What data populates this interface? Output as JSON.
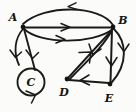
{
  "figure": {
    "background_color": "#fbfbf9",
    "ink_color": "#1a1a18",
    "width": 136,
    "height": 112
  },
  "nodes": [
    {
      "id": "A",
      "label": "A",
      "x": 23,
      "y": 27,
      "label_x": 13,
      "label_y": 20,
      "type": "vertex"
    },
    {
      "id": "B",
      "label": "B",
      "x": 113,
      "y": 27,
      "label_x": 121,
      "label_y": 23,
      "type": "vertex"
    },
    {
      "id": "C",
      "label": "C",
      "x": 31,
      "y": 82,
      "label_x": 31,
      "label_y": 85,
      "type": "vertex-loop"
    },
    {
      "id": "D",
      "label": "D",
      "x": 67,
      "y": 79,
      "label_x": 64,
      "label_y": 95,
      "type": "vertex"
    },
    {
      "id": "E",
      "label": "E",
      "x": 110,
      "y": 84,
      "label_x": 108,
      "label_y": 101,
      "type": "vertex"
    }
  ],
  "edges": [
    {
      "id": "e1",
      "from": "B",
      "to": "A",
      "style": "arc-above",
      "arrow_direction": "left"
    },
    {
      "id": "e2",
      "from": "A",
      "to": "B",
      "style": "straight",
      "arrow_direction": "right"
    },
    {
      "id": "e3",
      "from": "A",
      "to": "B",
      "style": "arc-below",
      "arrow_direction": "right"
    },
    {
      "id": "e4",
      "from": "A",
      "to": "C",
      "style": "arc-left",
      "arrow_direction": "down"
    },
    {
      "id": "e5",
      "from": "A",
      "to": "C",
      "style": "straight",
      "arrow_direction": "down"
    },
    {
      "id": "e6",
      "from": "C",
      "to": "C",
      "style": "self-loop",
      "arrow_direction": "ccw"
    },
    {
      "id": "e7",
      "from": "D",
      "to": "B",
      "style": "straight",
      "arrow_direction": "up-right"
    },
    {
      "id": "e8",
      "from": "B",
      "to": "D",
      "style": "arc-curved",
      "arrow_direction": "down-left"
    },
    {
      "id": "e9",
      "from": "B",
      "to": "E",
      "style": "straight",
      "arrow_direction": "down"
    },
    {
      "id": "e10",
      "from": "B",
      "to": "E",
      "style": "arc-right",
      "arrow_direction": "down"
    },
    {
      "id": "e11",
      "from": "E",
      "to": "D",
      "style": "straight",
      "arrow_direction": "left"
    }
  ],
  "counts": {
    "vertices": 5,
    "edges": 11
  }
}
